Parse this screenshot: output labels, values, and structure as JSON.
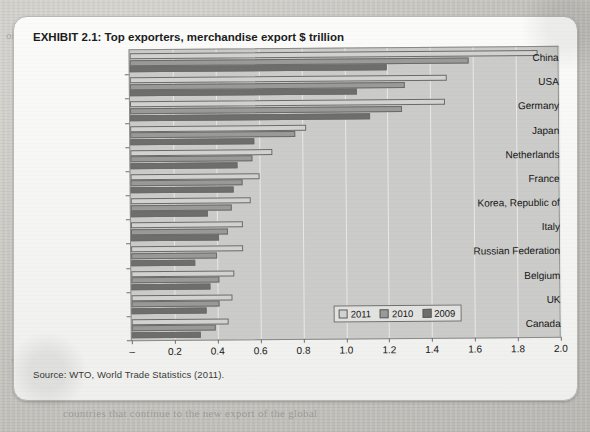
{
  "exhibit": {
    "label": "EXHIBIT 2.1:",
    "title": "Top exporters, merchandise export $ trillion",
    "source": "Source: WTO, World Trade Statistics (2011)."
  },
  "background_text": [
    "or the in a ers of so on ser 2.2 )",
    "and the report of the",
    "Kong",
    "econom",
    "a exports",
    "import fr",
    "ation of t",
    "ent of his",
    "mostly",
    "a the pro",
    "and nation sur sed",
    "in and the tra",
    "of the chan the",
    "largest and the",
    "the comp",
    "main the imports of",
    "over and in the s",
    "traded in the world",
    "of the economy of",
    "world trade and the emergence of multipolar economics",
    "the world trade has also affected the trade patterns",
    "countries that continue to the new export of the global"
  ],
  "legend_position": "inside-bottom-right",
  "colors": {
    "series_2011": "#d2d2d0",
    "series_2010": "#9a9a98",
    "series_2009": "#6e6e6c",
    "plot_background": "#cbcbc9",
    "gridline": "#e9e9e7",
    "axis": "#6f6f6d",
    "card_background": "#fbfbfa",
    "page_background": "#cdcbc6"
  },
  "chart_data": {
    "type": "bar",
    "orientation": "horizontal",
    "title": "Top exporters, merchandise export $ trillion",
    "xlabel": "",
    "ylabel": "",
    "xlim": [
      0,
      2.0
    ],
    "xticks": [
      0,
      0.2,
      0.4,
      0.6,
      0.8,
      1.0,
      1.2,
      1.4,
      1.6,
      1.8,
      2.0
    ],
    "xticklabels": [
      "–",
      "0.2",
      "0.4",
      "0.6",
      "0.8",
      "1.0",
      "1.2",
      "1.4",
      "1.6",
      "1.8",
      "2.0"
    ],
    "grid": true,
    "grid_axis": "x",
    "legend": [
      "2011",
      "2010",
      "2009"
    ],
    "categories": [
      "China",
      "USA",
      "Germany",
      "Japan",
      "Netherlands",
      "France",
      "Korea, Republic of",
      "Italy",
      "Russian Federation",
      "Belgium",
      "UK",
      "Canada"
    ],
    "series": [
      {
        "name": "2011",
        "color": "#d2d2d0",
        "values": [
          1.9,
          1.48,
          1.47,
          0.82,
          0.66,
          0.6,
          0.56,
          0.52,
          0.52,
          0.48,
          0.47,
          0.45
        ]
      },
      {
        "name": "2010",
        "color": "#9a9a98",
        "values": [
          1.58,
          1.28,
          1.27,
          0.77,
          0.57,
          0.52,
          0.47,
          0.45,
          0.4,
          0.41,
          0.41,
          0.39
        ]
      },
      {
        "name": "2009",
        "color": "#6e6e6c",
        "values": [
          1.2,
          1.06,
          1.12,
          0.58,
          0.5,
          0.48,
          0.36,
          0.41,
          0.3,
          0.37,
          0.35,
          0.32
        ]
      }
    ]
  }
}
